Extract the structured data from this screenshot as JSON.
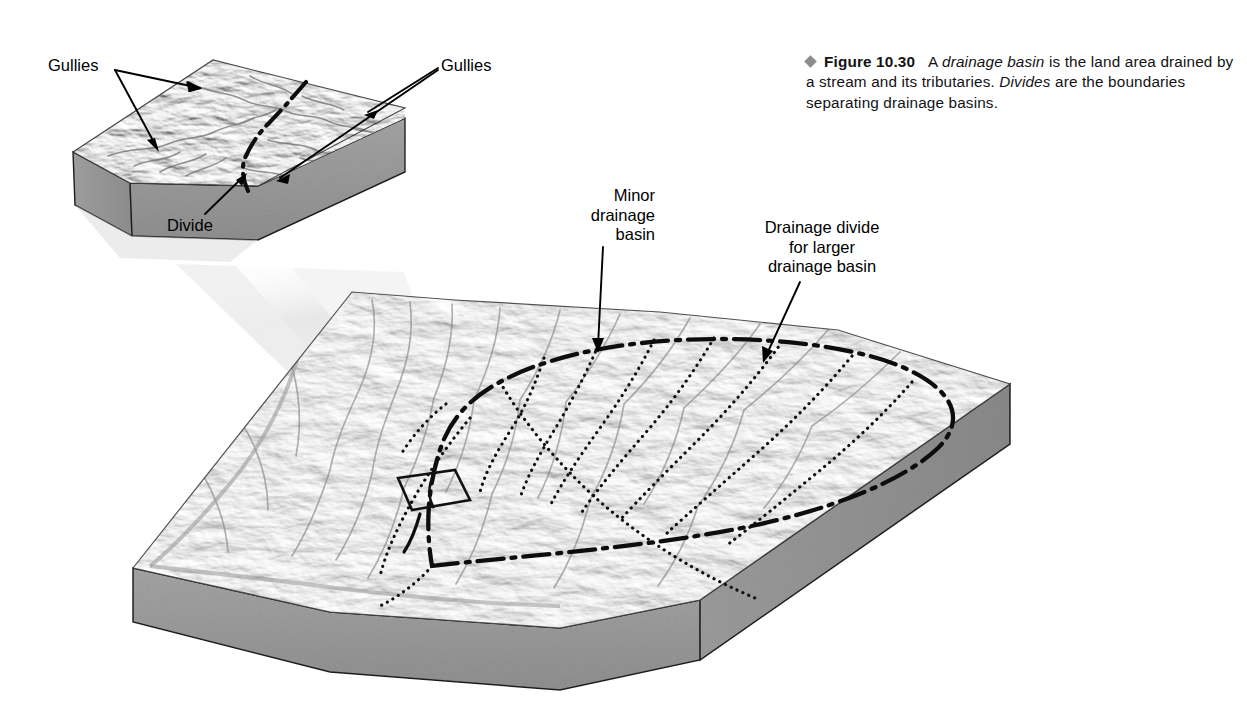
{
  "figure": {
    "bullet_icon": "diamond-bullet",
    "number_label": "Figure 10.30",
    "caption_part1": "A ",
    "caption_italic1": "drainage basin",
    "caption_part2": " is the land area drained by a stream and its tributaries. ",
    "caption_italic2": "Divides",
    "caption_part3": " are the boundaries separating drainage basins.",
    "bullet_color": "#8c8c8c"
  },
  "labels": {
    "gullies_left": "Gullies",
    "gullies_right": "Gullies",
    "divide": "Divide",
    "minor_drainage_basin": "Minor\ndrainage\nbasin",
    "drainage_divide_larger": "Drainage divide\nfor larger\ndrainage basin"
  },
  "diagram": {
    "type": "block-diagram",
    "blocks": [
      {
        "name": "inset-magnified-block",
        "description": "Magnified close-up block of gullied terrain with a divide",
        "features": [
          "gullies",
          "divide",
          "terrain-surface",
          "side-face",
          "front-face"
        ]
      },
      {
        "name": "main-landscape-block",
        "description": "Large landscape block showing a drainage basin bounded by a drainage divide, with minor drainage basins inside",
        "features": [
          "drainage-divide",
          "minor-basin-divides",
          "stream-network",
          "terrain-surface",
          "side-face",
          "front-face",
          "magnification-window"
        ]
      }
    ],
    "connector": "magnification-cone",
    "line_styles": {
      "major_divide": "dash-dot",
      "minor_divide": "dotted",
      "leader": "solid-arrow"
    },
    "colors": {
      "terrain_light": "#d8d6d2",
      "terrain_mid": "#b5b2ae",
      "terrain_dark": "#8e8b87",
      "block_side": "#9b9b9b",
      "outline": "#1a1a1a",
      "cone": "#e9e9e9"
    }
  }
}
